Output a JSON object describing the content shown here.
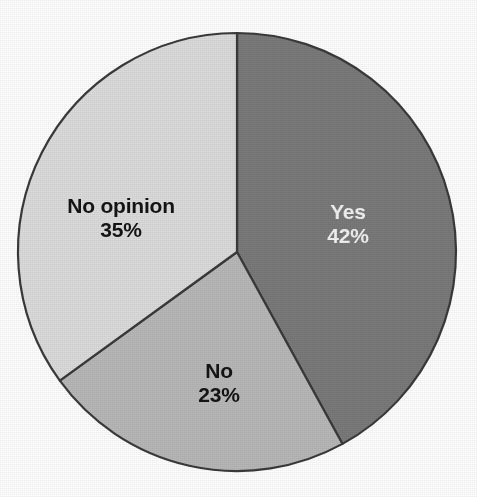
{
  "chart_data": {
    "type": "pie",
    "title": "",
    "subtitle": "",
    "xlabel": "",
    "ylabel": "",
    "legend_position": "none",
    "grid": false,
    "labels_inside_slices": true,
    "start_angle_deg": 0,
    "direction": "clockwise",
    "categories": [
      "Yes",
      "No",
      "No opinion"
    ],
    "values": [
      42,
      23,
      35
    ],
    "value_suffix": "%",
    "slices": [
      {
        "label": "Yes",
        "value": 42,
        "value_text": "42%",
        "color": "#7a7a7a",
        "text_color": "#f2f2f2",
        "start_deg": 0,
        "end_deg": 151.2
      },
      {
        "label": "No",
        "value": 23,
        "value_text": "23%",
        "color": "#b8b8b8",
        "text_color": "#141414",
        "start_deg": 151.2,
        "end_deg": 234.0
      },
      {
        "label": "No opinion",
        "value": 35,
        "value_text": "35%",
        "color": "#dcdcdc",
        "text_color": "#141414",
        "start_deg": 234.0,
        "end_deg": 360.0
      }
    ]
  },
  "figure": {
    "background_color": "#ffffff",
    "outline_color": "#3a3a3a",
    "center_x": 237,
    "center_y": 252,
    "radius": 219
  },
  "labels": {
    "yes_name": "Yes",
    "yes_value": "42%",
    "no_name": "No",
    "no_value": "23%",
    "no_opinion_name": "No opinion",
    "no_opinion_value": "35%"
  }
}
